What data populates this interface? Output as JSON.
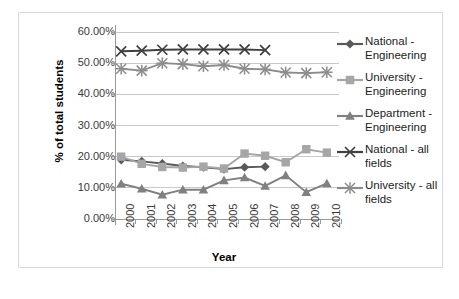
{
  "chart_data": {
    "type": "line",
    "title": "",
    "xlabel": "Year",
    "ylabel": "% of total students",
    "categories": [
      "2000",
      "2001",
      "2002",
      "2003",
      "2004",
      "2005",
      "2006",
      "2007",
      "2008",
      "2009",
      "2010"
    ],
    "ylim": [
      0,
      60
    ],
    "ytick_labels": [
      "0.00%",
      "10.00%",
      "20.00%",
      "30.00%",
      "40.00%",
      "50.00%",
      "60.00%"
    ],
    "ytick_values": [
      0,
      10,
      20,
      30,
      40,
      50,
      60
    ],
    "grid": true,
    "legend_position": "right",
    "series": [
      {
        "name": "National - Engineering",
        "legend_label": "National -\nEngineering",
        "marker": "diamond",
        "color": "#595959",
        "x": [
          "2000",
          "2001",
          "2002",
          "2003",
          "2004",
          "2005",
          "2006",
          "2007"
        ],
        "values": [
          19.0,
          18.5,
          17.8,
          17.0,
          16.6,
          16.0,
          16.6,
          16.8
        ]
      },
      {
        "name": "University - Engineering",
        "legend_label": "University -\nEngineering",
        "marker": "square",
        "color": "#a6a6a6",
        "x": [
          "2000",
          "2001",
          "2002",
          "2003",
          "2004",
          "2005",
          "2006",
          "2007",
          "2008",
          "2009",
          "2010"
        ],
        "values": [
          20.0,
          17.7,
          16.7,
          16.5,
          16.8,
          16.2,
          21.0,
          20.3,
          18.2,
          22.4,
          21.3
        ]
      },
      {
        "name": "Department - Engineering",
        "legend_label": "Department -\nEngineering",
        "marker": "triangle",
        "color": "#808080",
        "x": [
          "2000",
          "2001",
          "2002",
          "2003",
          "2004",
          "2005",
          "2006",
          "2007",
          "2008",
          "2009",
          "2010"
        ],
        "values": [
          11.3,
          9.7,
          7.8,
          9.4,
          9.4,
          12.4,
          13.3,
          10.6,
          14.0,
          8.6,
          11.4
        ]
      },
      {
        "name": "National - all fields",
        "legend_label": "National - all\nfields",
        "marker": "x",
        "color": "#404040",
        "x": [
          "2000",
          "2001",
          "2002",
          "2003",
          "2004",
          "2005",
          "2006",
          "2007"
        ],
        "values": [
          53.8,
          54.0,
          54.3,
          54.4,
          54.4,
          54.4,
          54.4,
          54.2
        ]
      },
      {
        "name": "University - all fields",
        "legend_label": "University - all\nfields",
        "marker": "asterisk",
        "color": "#8c8c8c",
        "x": [
          "2000",
          "2001",
          "2002",
          "2003",
          "2004",
          "2005",
          "2006",
          "2007",
          "2008",
          "2009",
          "2010"
        ],
        "values": [
          48.2,
          47.6,
          50.0,
          49.7,
          49.0,
          49.4,
          48.2,
          48.0,
          47.0,
          46.8,
          47.1
        ]
      }
    ]
  }
}
